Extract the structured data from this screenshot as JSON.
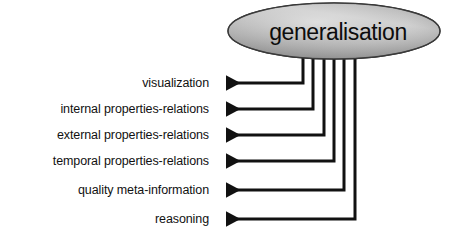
{
  "diagram": {
    "title": "generalisation",
    "root_node": {
      "label": "generalisation",
      "shape": "ellipse",
      "fill_light": "#e8e8e8",
      "fill_mid": "#b4b4b4",
      "fill_dark": "#7d7d7d",
      "stroke": "#2b2b2b",
      "center_x": 334,
      "center_y": 31,
      "radius_x": 106,
      "radius_y": 28
    },
    "connector": {
      "stroke": "#111111",
      "stroke_width": 3,
      "arrowhead": "left-triangle",
      "style": "orthogonal-elbow"
    },
    "leaves": [
      {
        "label": "visualization",
        "y": 83,
        "stem_x": 303,
        "arrow_tip_x": 214
      },
      {
        "label": "internal properties-relations",
        "y": 109,
        "stem_x": 313,
        "arrow_tip_x": 214
      },
      {
        "label": "external properties-relations",
        "y": 135,
        "stem_x": 324,
        "arrow_tip_x": 214
      },
      {
        "label": "temporal properties-relations",
        "y": 161,
        "stem_x": 334,
        "arrow_tip_x": 214
      },
      {
        "label": "quality meta-information",
        "y": 190,
        "stem_x": 344,
        "arrow_tip_x": 214
      },
      {
        "label": "reasoning",
        "y": 219,
        "stem_x": 355,
        "arrow_tip_x": 214
      }
    ]
  }
}
